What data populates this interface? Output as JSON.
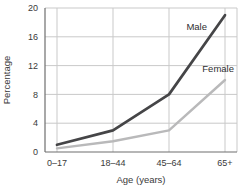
{
  "chart_data": {
    "type": "line",
    "title": "",
    "categories": [
      "0–17",
      "18–44",
      "45–64",
      "65+"
    ],
    "series": [
      {
        "name": "Male",
        "values": [
          1,
          3,
          8,
          19
        ],
        "color": "#454547",
        "label_color": "#2e2e30"
      },
      {
        "name": "Female",
        "values": [
          0.5,
          1.5,
          3,
          10
        ],
        "color": "#b9b9ba",
        "label_color": "#2e2e30"
      }
    ],
    "xlabel": "Age (years)",
    "ylabel": "Percentage",
    "ylim": [
      0,
      20
    ],
    "yticks": [
      0,
      4,
      8,
      12,
      16,
      20
    ],
    "grid": true,
    "legend_position": "inline-labels",
    "colors": {
      "grid": "#c9c9c9",
      "axis": "#6e6e6e",
      "text": "#3a3a3a",
      "background": "#ffffff"
    }
  }
}
